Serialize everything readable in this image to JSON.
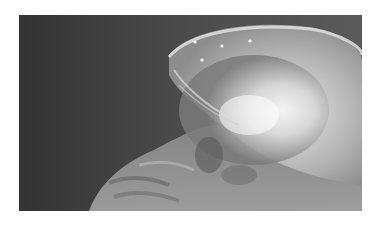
{
  "image": {
    "subject": "lateral skull x-ray radiograph",
    "colors": {
      "background": "#ffffff",
      "film_dark": "#3a3a3a",
      "bone_bright": "#f2f2f2",
      "soft_tissue": "#8a8a8a"
    },
    "markers": [
      {
        "x": 176,
        "y": 27
      },
      {
        "x": 203,
        "y": 31
      },
      {
        "x": 231,
        "y": 26
      },
      {
        "x": 183,
        "y": 45
      }
    ]
  }
}
